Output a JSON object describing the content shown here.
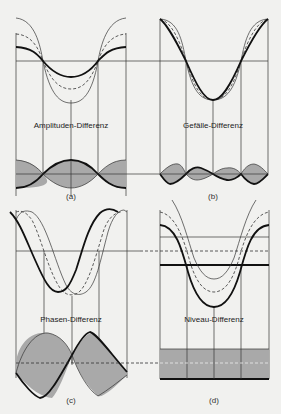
{
  "figure": {
    "background": "#f1f1ef",
    "shade_color": "#a9a9a9",
    "panels": [
      {
        "id": "a",
        "title": "Amplituden-Differenz",
        "caption": "(a)"
      },
      {
        "id": "b",
        "title": "Gefälle-Differenz",
        "caption": "(b)"
      },
      {
        "id": "c",
        "title": "Phasen-Differenz",
        "caption": "(c)"
      },
      {
        "id": "d",
        "title": "Niveau-Differenz",
        "caption": "(d)"
      }
    ]
  },
  "legend": {
    "curve_styles": [
      "thin solid",
      "dashed",
      "thick solid"
    ]
  }
}
